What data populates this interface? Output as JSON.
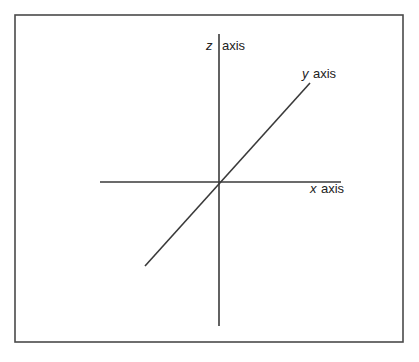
{
  "diagram": {
    "type": "3d-coordinate-axes",
    "axes": [
      {
        "id": "x",
        "variable": "x",
        "word": "axis"
      },
      {
        "id": "y",
        "variable": "y",
        "word": "axis"
      },
      {
        "id": "z",
        "variable": "z",
        "word": "axis"
      }
    ],
    "colors": {
      "line": "#3a3a3a",
      "frame": "#4a4a4a",
      "background": "#ffffff",
      "text": "#222222"
    }
  }
}
